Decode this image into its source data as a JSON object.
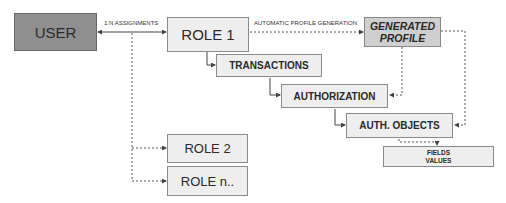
{
  "diagram": {
    "nodes": {
      "user": "USER",
      "role1": "ROLE 1",
      "generated_profile_line1": "GENERATED",
      "generated_profile_line2": "PROFILE",
      "transactions": "TRANSACTIONS",
      "authorization": "AUTHORIZATION",
      "auth_objects": "AUTH. OBJECTS",
      "fields_line1": "FIELDS",
      "fields_line2": "VALUES",
      "role2": "ROLE 2",
      "rolen": "ROLE n.."
    },
    "edge_labels": {
      "assignments": "1:N ASSIGNMENTS",
      "profile_generation": "AUTOMATIC PROFILE GENERATION"
    },
    "colors": {
      "user_fill": "#8f8f8f",
      "profile_fill": "#cfcfcf",
      "box_fill": "#eeeeee",
      "line": "#555555"
    }
  }
}
